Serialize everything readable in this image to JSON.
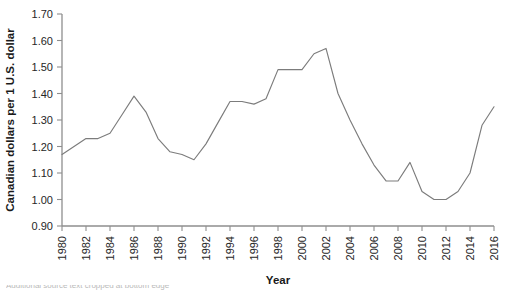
{
  "chart_data": {
    "type": "line",
    "title": "",
    "xlabel": "Year",
    "ylabel": "Canadian dollars per 1 U.S. dollar",
    "xlim": [
      1980,
      2016
    ],
    "ylim": [
      0.9,
      1.7
    ],
    "grid": false,
    "legend": "none",
    "ytick_labels": [
      "1.70",
      "1.60",
      "1.50",
      "1.40",
      "1.30",
      "1.20",
      "1.10",
      "1.00",
      "0.90"
    ],
    "ytick_values": [
      1.7,
      1.6,
      1.5,
      1.4,
      1.3,
      1.2,
      1.1,
      1.0,
      0.9
    ],
    "xtick_labels": [
      "1980",
      "1982",
      "1984",
      "1986",
      "1988",
      "1990",
      "1992",
      "1994",
      "1996",
      "1998",
      "2000",
      "2002",
      "2004",
      "2006",
      "2008",
      "2010",
      "2012",
      "2014",
      "2016"
    ],
    "xtick_values": [
      1980,
      1982,
      1984,
      1986,
      1988,
      1990,
      1992,
      1994,
      1996,
      1998,
      2000,
      2002,
      2004,
      2006,
      2008,
      2010,
      2012,
      2014,
      2016
    ],
    "x": [
      1980,
      1981,
      1982,
      1983,
      1984,
      1985,
      1986,
      1987,
      1988,
      1989,
      1990,
      1991,
      1992,
      1993,
      1994,
      1995,
      1996,
      1997,
      1998,
      1999,
      2000,
      2001,
      2002,
      2003,
      2004,
      2005,
      2006,
      2007,
      2008,
      2009,
      2010,
      2011,
      2012,
      2013,
      2014,
      2015,
      2016
    ],
    "values": [
      1.17,
      1.2,
      1.23,
      1.23,
      1.25,
      1.32,
      1.39,
      1.33,
      1.23,
      1.18,
      1.17,
      1.15,
      1.21,
      1.29,
      1.37,
      1.37,
      1.36,
      1.38,
      1.49,
      1.49,
      1.49,
      1.55,
      1.57,
      1.4,
      1.3,
      1.21,
      1.13,
      1.07,
      1.07,
      1.14,
      1.03,
      1.0,
      1.0,
      1.03,
      1.1,
      1.28,
      1.35
    ],
    "series": [
      {
        "name": "Canadian dollars per 1 U.S. dollar",
        "color": "#7c7c7c",
        "values": [
          1.17,
          1.2,
          1.23,
          1.23,
          1.25,
          1.32,
          1.39,
          1.33,
          1.23,
          1.18,
          1.17,
          1.15,
          1.21,
          1.29,
          1.37,
          1.37,
          1.36,
          1.38,
          1.49,
          1.49,
          1.49,
          1.55,
          1.57,
          1.4,
          1.3,
          1.21,
          1.13,
          1.07,
          1.07,
          1.14,
          1.03,
          1.0,
          1.0,
          1.03,
          1.1,
          1.28,
          1.35
        ]
      }
    ]
  },
  "footer": {
    "cropped_note": "Additional source text cropped at bottom edge"
  }
}
